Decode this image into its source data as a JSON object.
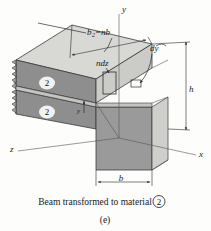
{
  "figure": {
    "caption_main": "Beam transformed to material",
    "caption_material_symbol": "2",
    "caption_part": "(e)",
    "axes": {
      "x": "x",
      "y": "y",
      "z": "z"
    },
    "labels": {
      "top_width_base": "b",
      "top_width_subscript": "2",
      "top_width_equals": "=nb",
      "element_width": "ndz",
      "element_height": "dy",
      "height": "h",
      "bottom_width": "b",
      "coord_y": "y"
    },
    "material_tags": [
      {
        "name": "upper-flange-material",
        "value": "2"
      },
      {
        "name": "lower-flange-material",
        "value": "2"
      }
    ],
    "colors": {
      "face_dark": "#8a8a8a",
      "face_mid": "#9e9e9e",
      "face_light": "#c9c9c6",
      "face_top": "#d8d8d4",
      "outline": "#3a3a3a",
      "text": "#1a1a1a",
      "background": "#fdfdfc"
    }
  }
}
